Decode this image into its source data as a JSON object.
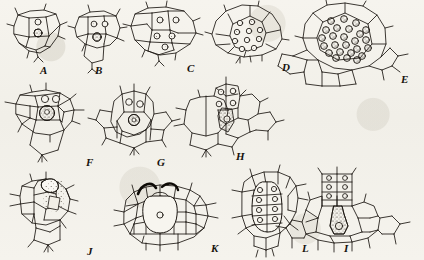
{
  "plate": {
    "title": "Plate of cell-development drawings",
    "medium": "pen-and-ink line drawing on aged paper",
    "background_color": "#f4f2ec",
    "ink_color": "#1a1510",
    "figure_count": 12,
    "label_order": [
      "A",
      "B",
      "C",
      "D",
      "E",
      "F",
      "G",
      "H",
      "J",
      "K",
      "L",
      "I"
    ]
  },
  "figures": [
    {
      "id": "A",
      "label": "A",
      "label_x": 40,
      "label_y": 65,
      "row": 1,
      "column": 1,
      "description": "small cell group with two stippled nuclei, one above the other",
      "nucleus_count": 2,
      "stippled": true
    },
    {
      "id": "B",
      "label": "B",
      "label_x": 95,
      "label_y": 65,
      "row": 1,
      "column": 2,
      "description": "cell group with two clear apical cells over one large stippled nucleus",
      "nucleus_count": 3,
      "stippled": true
    },
    {
      "id": "C",
      "label": "C",
      "label_x": 187,
      "label_y": 63,
      "row": 1,
      "column": 3,
      "description": "wider cell group with five ringed nuclei arranged in two tiers",
      "nucleus_count": 5,
      "stippled": false
    },
    {
      "id": "D",
      "label": "D",
      "label_x": 282,
      "label_y": 62,
      "row": 1,
      "column": 4,
      "description": "dome-shaped group packed with about ten ringed nuclei",
      "nucleus_count": 10,
      "stippled": false
    },
    {
      "id": "E",
      "label": "E",
      "label_x": 401,
      "label_y": 74,
      "row": 1,
      "column": 5,
      "description": "large rounded sporangium enclosing roughly twenty-five stippled spore nuclei",
      "nucleus_count": 25,
      "stippled": true
    },
    {
      "id": "F",
      "label": "F",
      "label_x": 86,
      "label_y": 157,
      "row": 2,
      "column": 1,
      "description": "cell group with two apical nuclei above one large densely stippled central cell",
      "nucleus_count": 3,
      "stippled": true
    },
    {
      "id": "G",
      "label": "G",
      "label_x": 157,
      "label_y": 157,
      "row": 2,
      "column": 2,
      "description": "upright group with two clear upper nuclei and a stippled lower nucleus",
      "nucleus_count": 3,
      "stippled": true
    },
    {
      "id": "H",
      "label": "H",
      "label_x": 236,
      "label_y": 151,
      "row": 2,
      "column": 3,
      "description": "tissue field with narrow stippled central cell and three nuclei above",
      "nucleus_count": 4,
      "stippled": true
    },
    {
      "id": "J",
      "label": "J",
      "label_x": 87,
      "label_y": 246,
      "row": 3,
      "column": 1,
      "description": "cell group with heavy stipple shading filling the central cells",
      "nucleus_count": 1,
      "stippled": true
    },
    {
      "id": "K",
      "label": "K",
      "label_x": 211,
      "label_y": 243,
      "row": 3,
      "column": 2,
      "description": "broad tissue sheet with two thick dark arcs over a central oval cell",
      "nucleus_count": 1,
      "stippled": false
    },
    {
      "id": "L",
      "label": "L",
      "label_x": 302,
      "label_y": 243,
      "row": 3,
      "column": 3,
      "description": "elongate axial body containing about eight ringed nuclei in two files",
      "nucleus_count": 8,
      "stippled": false
    },
    {
      "id": "I",
      "label": "I",
      "label_x": 344,
      "label_y": 243,
      "row": 3,
      "column": 4,
      "description": "tissue field with stalked apical cells over a stippled flask-shaped cell",
      "nucleus_count": 4,
      "stippled": true
    }
  ]
}
